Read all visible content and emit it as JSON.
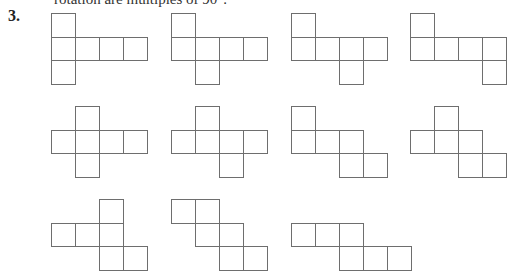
{
  "page": {
    "intro_text": "rotation are multiples of 90°.",
    "question_number": "3."
  },
  "figure": {
    "unit_px": 24,
    "line_color": "#6e6e6e",
    "nets": [
      {
        "id": "net-1",
        "x": 51,
        "y": 13,
        "cells": [
          [
            0,
            0
          ],
          [
            1,
            0
          ],
          [
            1,
            1
          ],
          [
            1,
            2
          ],
          [
            1,
            3
          ],
          [
            2,
            0
          ]
        ]
      },
      {
        "id": "net-2",
        "x": 171,
        "y": 13,
        "cells": [
          [
            0,
            0
          ],
          [
            1,
            0
          ],
          [
            1,
            1
          ],
          [
            1,
            2
          ],
          [
            1,
            3
          ],
          [
            2,
            1
          ]
        ]
      },
      {
        "id": "net-3",
        "x": 291,
        "y": 13,
        "cells": [
          [
            0,
            0
          ],
          [
            1,
            0
          ],
          [
            1,
            1
          ],
          [
            1,
            2
          ],
          [
            1,
            3
          ],
          [
            2,
            2
          ]
        ]
      },
      {
        "id": "net-4",
        "x": 410,
        "y": 13,
        "cells": [
          [
            0,
            0
          ],
          [
            1,
            0
          ],
          [
            1,
            1
          ],
          [
            1,
            2
          ],
          [
            1,
            3
          ],
          [
            2,
            3
          ]
        ]
      },
      {
        "id": "net-5",
        "x": 51,
        "y": 106,
        "cells": [
          [
            0,
            1
          ],
          [
            1,
            0
          ],
          [
            1,
            1
          ],
          [
            1,
            2
          ],
          [
            1,
            3
          ],
          [
            2,
            1
          ]
        ]
      },
      {
        "id": "net-6",
        "x": 171,
        "y": 106,
        "cells": [
          [
            0,
            1
          ],
          [
            1,
            0
          ],
          [
            1,
            1
          ],
          [
            1,
            2
          ],
          [
            1,
            3
          ],
          [
            2,
            2
          ]
        ]
      },
      {
        "id": "net-7",
        "x": 291,
        "y": 106,
        "cells": [
          [
            0,
            0
          ],
          [
            1,
            0
          ],
          [
            1,
            1
          ],
          [
            1,
            2
          ],
          [
            2,
            2
          ],
          [
            2,
            3
          ]
        ]
      },
      {
        "id": "net-8",
        "x": 410,
        "y": 106,
        "cells": [
          [
            0,
            1
          ],
          [
            1,
            0
          ],
          [
            1,
            1
          ],
          [
            1,
            2
          ],
          [
            2,
            2
          ],
          [
            2,
            3
          ]
        ]
      },
      {
        "id": "net-9",
        "x": 51,
        "y": 199,
        "cells": [
          [
            0,
            2
          ],
          [
            1,
            0
          ],
          [
            1,
            1
          ],
          [
            1,
            2
          ],
          [
            2,
            2
          ],
          [
            2,
            3
          ]
        ]
      },
      {
        "id": "net-10",
        "x": 171,
        "y": 199,
        "cells": [
          [
            0,
            0
          ],
          [
            0,
            1
          ],
          [
            1,
            1
          ],
          [
            1,
            2
          ],
          [
            2,
            2
          ],
          [
            2,
            3
          ]
        ]
      },
      {
        "id": "net-11",
        "x": 291,
        "y": 199,
        "cells": [
          [
            1,
            0
          ],
          [
            1,
            1
          ],
          [
            1,
            2
          ],
          [
            2,
            2
          ],
          [
            2,
            3
          ],
          [
            2,
            4
          ]
        ]
      }
    ]
  }
}
